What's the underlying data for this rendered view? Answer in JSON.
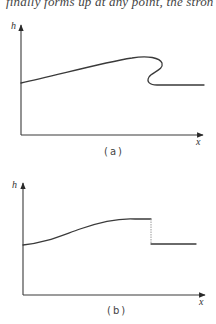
{
  "page": {
    "header_text": "finally forms up at any point, the stron"
  },
  "figures": [
    {
      "id": "a",
      "caption": "(a)",
      "y_axis_label": "h",
      "x_axis_label": "x",
      "description": "Wave profile overturning: height rises smoothly, then curls back on itself (multivalued) before settling to a lower flat level"
    },
    {
      "id": "b",
      "caption": "(b)",
      "y_axis_label": "h",
      "x_axis_label": "x",
      "description": "Same profile with a discontinuous jump (bore/shock) replacing the overturned region"
    }
  ],
  "colors": {
    "line": "#3a3a3a",
    "axis": "#3a3a3a",
    "jump": "#9a9a9a"
  }
}
